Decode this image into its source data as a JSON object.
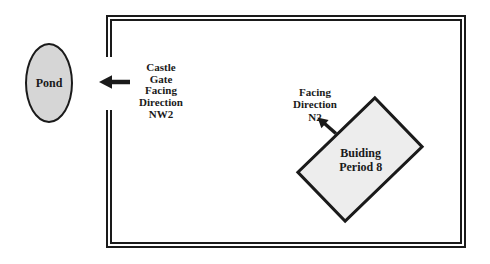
{
  "diagram": {
    "pond": {
      "label": "Pond"
    },
    "castle_gate": {
      "lines": [
        "Castle",
        "Gate",
        "Facing",
        "Direction",
        "NW2"
      ]
    },
    "facing_n2": {
      "lines": [
        "Facing",
        "Direction",
        "N2"
      ]
    },
    "building": {
      "lines": [
        "Buiding",
        "Period 8"
      ]
    }
  },
  "colors": {
    "background": "#ffffff",
    "line": "#1a1a1a",
    "text": "#1a1a1a",
    "pond_fill": "#d6d6d6",
    "building_fill": "#ededed"
  }
}
